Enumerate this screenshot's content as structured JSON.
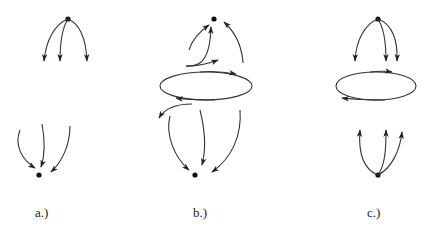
{
  "figure": {
    "panels": [
      {
        "label": "a.)",
        "description": "Source node with three outgoing arrows; sink node with three incoming arrows; no closed orbit",
        "top_node": "source",
        "bottom_node": "sink",
        "has_cycle": false
      },
      {
        "label": "b.)",
        "description": "Closed orbit (clockwise on top) between an upper sink and a lower sink; trajectories leave the orbit toward both nodes",
        "top_node": "sink",
        "bottom_node": "sink",
        "has_cycle": true,
        "cycle_direction": "clockwise"
      },
      {
        "label": "c.)",
        "description": "Upper source with three outgoing arrows toward a closed orbit; lower source with three outgoing arrows upward",
        "top_node": "source",
        "bottom_node": "source",
        "has_cycle": true,
        "cycle_direction": "clockwise"
      }
    ]
  }
}
